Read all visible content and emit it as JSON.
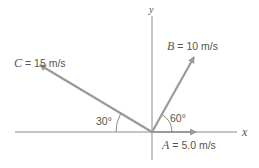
{
  "diagram": {
    "axes": {
      "x_label": "x",
      "y_label": "y"
    },
    "vectors": [
      {
        "name": "A",
        "magnitude_label": "= 5.0 m/s",
        "angle_deg": 0
      },
      {
        "name": "B",
        "magnitude_label": "= 10 m/s",
        "angle_deg": 60
      },
      {
        "name": "C",
        "magnitude_label": "= 15 m/s",
        "angle_deg": 150
      }
    ],
    "angles": [
      {
        "label": "60°",
        "between": "B and +x"
      },
      {
        "label": "30°",
        "between": "C and -x"
      }
    ],
    "colors": {
      "axis": "#6e6e6e",
      "vector": "#9a9a9a",
      "text": "#555555"
    }
  }
}
